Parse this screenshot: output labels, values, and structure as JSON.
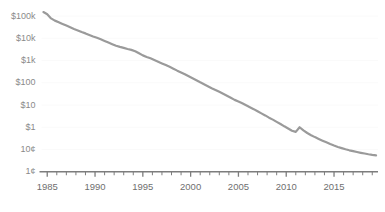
{
  "chart_data": {
    "type": "line",
    "title": "",
    "subtitle": "",
    "xlabel": "",
    "ylabel": "",
    "yscale": "log",
    "xscale": "linear",
    "grid": true,
    "legend": false,
    "legend_position": "none",
    "line_color": "#9a9a9a",
    "grid_color": "#fafafa",
    "axis_color": "#7d7d7d",
    "tick_label_color": "#6f6f6f",
    "ylim": [
      0.01,
      200000
    ],
    "xlim": [
      1984.4,
      2019.6
    ],
    "ytick_labels": [
      "$100k",
      "$10k",
      "$1k",
      "$100",
      "$10",
      "$1",
      "10¢",
      "1¢"
    ],
    "ytick_values": [
      100000,
      10000,
      1000,
      100,
      10,
      1,
      0.1,
      0.01
    ],
    "xtick_labels": [
      "1985",
      "1990",
      "1995",
      "2000",
      "2005",
      "2010",
      "2015"
    ],
    "xtick_values": [
      1985,
      1990,
      1995,
      2000,
      2005,
      2010,
      2015
    ],
    "minor_xtick_interval": 1,
    "x": [
      1984.6,
      1985.0,
      1985.4,
      1985.8,
      1986.2,
      1986.6,
      1987.0,
      1987.4,
      1987.8,
      1988.2,
      1988.6,
      1989.0,
      1989.4,
      1989.8,
      1990.2,
      1990.6,
      1991.0,
      1991.4,
      1991.8,
      1992.2,
      1992.6,
      1993.0,
      1993.4,
      1993.8,
      1994.2,
      1994.6,
      1995.0,
      1995.4,
      1995.8,
      1996.2,
      1996.6,
      1997.0,
      1997.4,
      1997.8,
      1998.2,
      1998.6,
      1999.0,
      1999.4,
      1999.8,
      2000.2,
      2000.6,
      2001.0,
      2001.4,
      2001.8,
      2002.2,
      2002.6,
      2003.0,
      2003.4,
      2003.8,
      2004.2,
      2004.6,
      2005.0,
      2005.4,
      2005.8,
      2006.2,
      2006.6,
      2007.0,
      2007.4,
      2007.8,
      2008.2,
      2008.6,
      2009.0,
      2009.4,
      2009.8,
      2010.2,
      2010.6,
      2011.0,
      2011.4,
      2011.8,
      2012.2,
      2012.6,
      2013.0,
      2013.4,
      2013.8,
      2014.2,
      2014.6,
      2015.0,
      2015.4,
      2015.8,
      2016.2,
      2016.6,
      2017.0,
      2017.4,
      2017.8,
      2018.2,
      2018.6,
      2019.0,
      2019.4
    ],
    "y": [
      150000,
      120000,
      78000,
      62000,
      52000,
      44000,
      37000,
      31000,
      26000,
      22500,
      19000,
      16500,
      14000,
      12000,
      10500,
      9000,
      7600,
      6400,
      5400,
      4600,
      4100,
      3700,
      3300,
      3000,
      2600,
      2100,
      1700,
      1450,
      1250,
      1050,
      880,
      740,
      620,
      520,
      430,
      350,
      290,
      240,
      195,
      160,
      130,
      105,
      86,
      70,
      57,
      47,
      39,
      32,
      26,
      21,
      17,
      14.5,
      12,
      9.8,
      8.0,
      6.5,
      5.2,
      4.2,
      3.4,
      2.7,
      2.2,
      1.75,
      1.4,
      1.1,
      0.88,
      0.7,
      0.62,
      1.0,
      0.72,
      0.55,
      0.44,
      0.36,
      0.3,
      0.25,
      0.21,
      0.175,
      0.15,
      0.13,
      0.115,
      0.102,
      0.092,
      0.084,
      0.077,
      0.071,
      0.066,
      0.061,
      0.057,
      0.054
    ]
  }
}
